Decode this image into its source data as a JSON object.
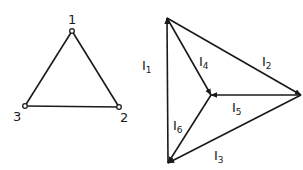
{
  "left_graph": {
    "nodes": [
      {
        "id": "1",
        "label": "1",
        "x": 72,
        "y": 31,
        "lx": 68,
        "ly": 24
      },
      {
        "id": "2",
        "label": "2",
        "x": 119,
        "y": 107,
        "lx": 120,
        "ly": 122
      },
      {
        "id": "3",
        "label": "3",
        "x": 25,
        "y": 106,
        "lx": 13,
        "ly": 121
      }
    ],
    "edges": [
      [
        "1",
        "2"
      ],
      [
        "2",
        "3"
      ],
      [
        "3",
        "1"
      ]
    ]
  },
  "right_graph": {
    "vertices": {
      "top": {
        "x": 167,
        "y": 18
      },
      "right": {
        "x": 301,
        "y": 95
      },
      "bottom": {
        "x": 168,
        "y": 163
      },
      "center": {
        "x": 211,
        "y": 95
      }
    },
    "currents": [
      {
        "id": "I1",
        "letter": "I",
        "sub": "1",
        "from": "bottom",
        "to": "top",
        "lx": 142,
        "ly": 70
      },
      {
        "id": "I2",
        "letter": "I",
        "sub": "2",
        "from": "top",
        "to": "right",
        "lx": 262,
        "ly": 66
      },
      {
        "id": "I3",
        "letter": "I",
        "sub": "3",
        "from": "right",
        "to": "bottom",
        "lx": 214,
        "ly": 160
      },
      {
        "id": "I4",
        "letter": "I",
        "sub": "4",
        "from": "top",
        "to": "center",
        "lx": 199,
        "ly": 66
      },
      {
        "id": "I5",
        "letter": "I",
        "sub": "5",
        "from": "right",
        "to": "center",
        "lx": 232,
        "ly": 112
      },
      {
        "id": "I6",
        "letter": "I",
        "sub": "6",
        "from": "center",
        "to": "bottom",
        "lx": 173,
        "ly": 130
      }
    ]
  }
}
